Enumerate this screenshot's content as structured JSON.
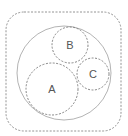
{
  "diagram": {
    "type": "circle-packing",
    "container": {
      "shape": "rounded-rect",
      "x": 6,
      "y": 12,
      "width": 115,
      "height": 119,
      "radius": 18,
      "stroke": "#888888",
      "dashed": true
    },
    "outer_circle": {
      "cx": 64,
      "cy": 73,
      "r": 47,
      "stroke": "#aaaaaa",
      "dashed": false
    },
    "circles": [
      {
        "label": "A",
        "cx": 52,
        "cy": 89,
        "r": 26
      },
      {
        "label": "B",
        "cx": 70,
        "cy": 45,
        "r": 18
      },
      {
        "label": "C",
        "cx": 93,
        "cy": 74,
        "r": 16
      }
    ],
    "colors": {
      "dashed_stroke": "#777777",
      "label": "#555555",
      "background": "#ffffff"
    }
  }
}
